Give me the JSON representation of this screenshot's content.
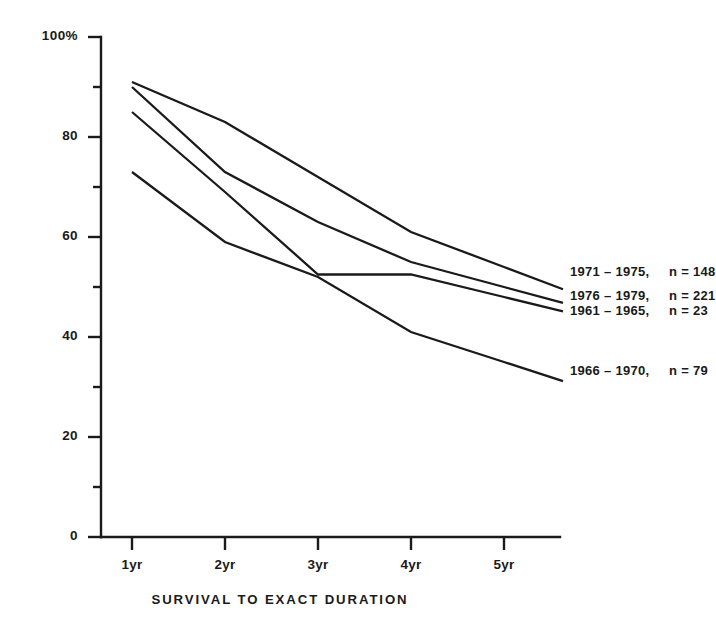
{
  "chart_data": {
    "type": "line",
    "title": "",
    "xlabel": "SURVIVAL TO EXACT DURATION",
    "ylabel": "",
    "categories": [
      "1yr",
      "2yr",
      "3yr",
      "4yr",
      "5yr"
    ],
    "ylim": [
      0,
      100
    ],
    "xlim": [
      0,
      5
    ],
    "grid": false,
    "legend_position": "right-inline",
    "y_ticks_major": [
      "0",
      "20",
      "40",
      "60",
      "80",
      "100%"
    ],
    "y_tick_values_major": [
      0,
      20,
      40,
      60,
      80,
      100
    ],
    "y_tick_values_minor": [
      10,
      30,
      50,
      70,
      90
    ],
    "series": [
      {
        "name": "1971 - 1975",
        "n_label": "n = 148",
        "n": 148,
        "values": [
          91,
          83,
          72,
          61,
          54
        ]
      },
      {
        "name": "1976 - 1979",
        "n_label": "n = 221",
        "n": 221,
        "values": [
          90,
          73,
          63,
          55,
          50
        ]
      },
      {
        "name": "1961 - 1965",
        "n_label": "n = 23",
        "n": 23,
        "values": [
          85,
          69,
          52.5,
          52.5,
          48
        ]
      },
      {
        "name": "1966 - 1970",
        "n_label": "n = 79",
        "n": 79,
        "values": [
          73,
          59,
          52,
          41,
          35
        ]
      }
    ]
  },
  "axis": {
    "y_labels": [
      "100%",
      "80",
      "60",
      "40",
      "20",
      "0"
    ],
    "x_labels": [
      "1yr",
      "2yr",
      "3yr",
      "4yr",
      "5yr"
    ],
    "x_title": "SURVIVAL TO EXACT DURATION"
  },
  "legend": {
    "entries": [
      {
        "period": "1971 – 1975,",
        "count": "n = 148"
      },
      {
        "period": "1976 – 1979,",
        "count": "n = 221"
      },
      {
        "period": "1961 – 1965,",
        "count": "n =  23"
      },
      {
        "period": "1966 – 1970,",
        "count": "n = 79"
      }
    ]
  },
  "style": {
    "ink": "#1a1a1a",
    "background": "#ffffff"
  }
}
